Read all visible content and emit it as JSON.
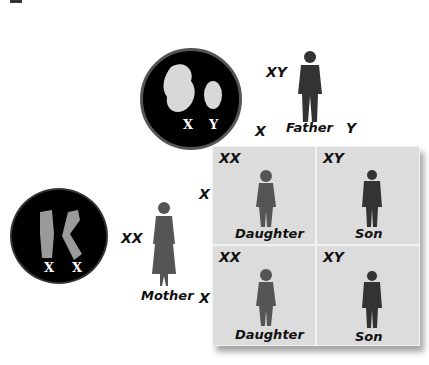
{
  "father": {
    "label": "Father",
    "genotype": "XY",
    "chromosomes": [
      "X",
      "Y"
    ]
  },
  "mother": {
    "label": "Mother",
    "genotype": "XX",
    "chromosomes": [
      "X",
      "X"
    ]
  },
  "columns": [
    "X",
    "Y"
  ],
  "rows": [
    "X",
    "X"
  ],
  "cells": [
    {
      "genotype": "XX",
      "label": "Daughter"
    },
    {
      "genotype": "XY",
      "label": "Son"
    },
    {
      "genotype": "XX",
      "label": "Daughter"
    },
    {
      "genotype": "XY",
      "label": "Son"
    }
  ],
  "colors": {
    "cell_bg": "#dcdcdc",
    "figure": "#444444",
    "circle": "#000000"
  }
}
